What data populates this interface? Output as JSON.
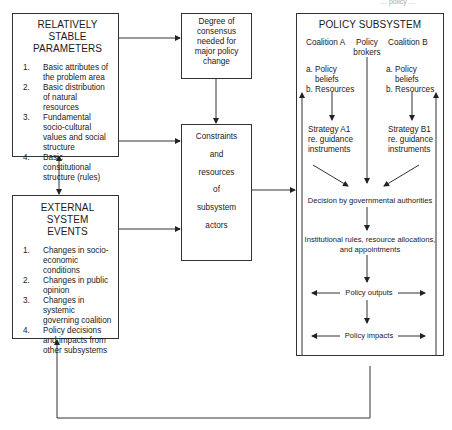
{
  "header": {
    "running_head": "… policy …"
  },
  "stable_parameters": {
    "title_line1": "RELATIVELY STABLE",
    "title_line2": "PARAMETERS",
    "items": [
      {
        "num": "1.",
        "text": "Basic attributes of the problem area"
      },
      {
        "num": "2.",
        "text": "Basic distribution of natural resources"
      },
      {
        "num": "3.",
        "text": "Fundamental socio-cultural values and social structure"
      },
      {
        "num": "4.",
        "text": "Basic constitutional structure (rules)"
      }
    ]
  },
  "external_events": {
    "title_line1": "EXTERNAL SYSTEM",
    "title_line2": "EVENTS",
    "items": [
      {
        "num": "1.",
        "text": "Changes in socio-economic conditions"
      },
      {
        "num": "2.",
        "text": "Changes in public opinion"
      },
      {
        "num": "3.",
        "text": "Changes in systemic governing coalition"
      },
      {
        "num": "4.",
        "text": "Policy decisions and impacts from other subsystems"
      }
    ]
  },
  "consensus": {
    "lines": [
      "Degree of",
      "consensus",
      "needed for",
      "major policy",
      "change"
    ]
  },
  "constraints": {
    "lines": [
      "Constraints",
      "and",
      "resources",
      "of",
      "subsystem",
      "actors"
    ]
  },
  "policy_subsystem": {
    "title": "POLICY SUBSYSTEM",
    "coalition_a": {
      "label": "Coalition A",
      "belief": "a. Policy",
      "belief2": "beliefs",
      "resources": "b. Resources",
      "strategy1": "Strategy A1",
      "strategy2": "re. guidance",
      "strategy3": "instruments"
    },
    "brokers": {
      "line1": "Policy",
      "line2": "brokers"
    },
    "coalition_b": {
      "label": "Coalition B",
      "belief": "a. Policy",
      "belief2": "beliefs",
      "resources": "b. Resources",
      "strategy1": "Strategy B1",
      "strategy2": "re. guidance",
      "strategy3": "instruments"
    },
    "decision": "Decision by governmental authorities",
    "institutional_1": "Institutional rules, resource allocations,",
    "institutional_2": "and appointments",
    "outputs": "Policy outputs",
    "impacts": "Policy impacts"
  },
  "colors": {
    "line": "#333333",
    "text": "#1a1a1a",
    "background": "#ffffff"
  }
}
